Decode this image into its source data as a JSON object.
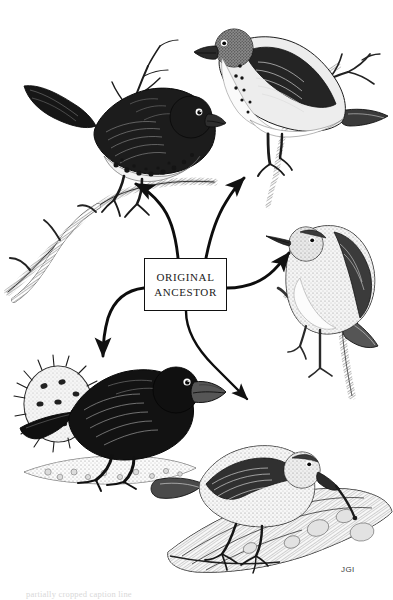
{
  "figure": {
    "background_color": "#ffffff",
    "ink_color": "#1a1a1a",
    "width": 393,
    "height": 600
  },
  "center_label": {
    "line1": "ORIGINAL",
    "line2": "ANCESTOR",
    "border_color": "#111111",
    "fill_color": "#ffffff"
  },
  "signature": {
    "text": "JGI"
  },
  "caption": {
    "text": "partially cropped caption line"
  },
  "birds": [
    {
      "id": "large-ground-finch-upper-left",
      "label": "dark finch with spotted flank perched on branch",
      "position": "top-left",
      "plumage": "dark",
      "beak": "thick conical"
    },
    {
      "id": "pale-finch-upper-right",
      "label": "pale finch with speckled breast facing left on twig",
      "position": "top-right",
      "plumage": "light",
      "beak": "stout conical"
    },
    {
      "id": "warbler-finch-right",
      "label": "warbler finch with slender pointed beak on vertical branch",
      "position": "middle-right",
      "plumage": "mottled grey",
      "beak": "thin pointed"
    },
    {
      "id": "cactus-ground-finch-lower-left",
      "label": "black ground finch feeding beside a spiny cactus pad",
      "position": "bottom-left",
      "plumage": "black",
      "beak": "heavy crushing"
    },
    {
      "id": "woodpecker-finch-lower-right",
      "label": "woodpecker finch holding a twig tool in its beak on a log",
      "position": "bottom-right",
      "plumage": "streaked brown",
      "beak": "straight probing"
    }
  ],
  "arrows": [
    {
      "id": "arrow-to-upper-left",
      "from": "original-ancestor",
      "to": "dark finch upper left"
    },
    {
      "id": "arrow-to-upper-right",
      "from": "original-ancestor",
      "to": "pale finch upper right"
    },
    {
      "id": "arrow-to-right",
      "from": "original-ancestor",
      "to": "warbler finch right"
    },
    {
      "id": "arrow-to-lower-left",
      "from": "original-ancestor",
      "to": "cactus ground finch lower left"
    },
    {
      "id": "arrow-to-lower-right",
      "from": "original-ancestor",
      "to": "woodpecker finch lower right"
    }
  ]
}
